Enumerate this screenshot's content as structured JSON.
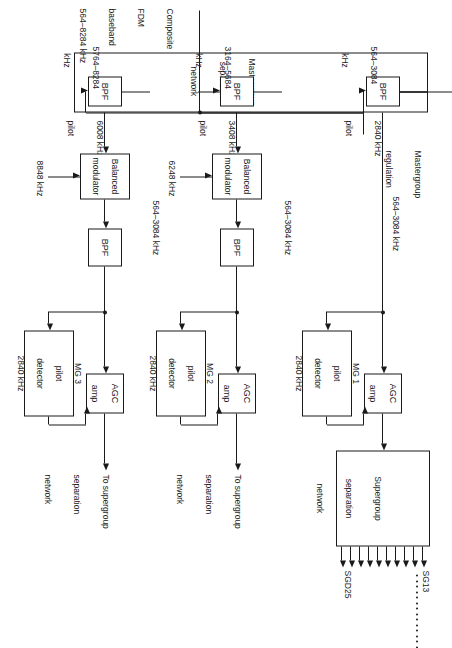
{
  "figure": {
    "orientation_deg": 90
  },
  "colors": {
    "ink": "#1a1a1a",
    "paper": "#ffffff"
  },
  "input": {
    "label_line1": "Composite",
    "label_line2": "FDM",
    "label_line3": "baseband",
    "label_line4": "564–8284 kHz"
  },
  "mastergroup_separation_network": {
    "title_line1": "Mastergroup",
    "title_line2": "separation",
    "title_line3": "network",
    "filters": [
      {
        "name": "BPF",
        "band_line1": "564–3084",
        "band_line2": "kHz"
      },
      {
        "name": "BPF",
        "band_line1": "3164–5684",
        "band_line2": "kHz"
      },
      {
        "name": "BPF",
        "band_line1": "5764–8284",
        "band_line2": "kHz"
      }
    ]
  },
  "pilots": [
    {
      "freq": "2840 kHz",
      "word": "pilot"
    },
    {
      "freq": "3408 kHz",
      "word": "pilot"
    },
    {
      "freq": "6008 kHz",
      "word": "pilot"
    }
  ],
  "chains": [
    {
      "id": "mg1",
      "has_modulator": false,
      "has_second_bpf": false,
      "regulation_line1": "Mastergroup",
      "regulation_line2": "regulation",
      "trunk_band": "564–3084 kHz",
      "agc_line1": "AGC",
      "agc_line2": "amp",
      "detector_line1": "MG 1",
      "detector_line2": "pilot",
      "detector_line3": "detector",
      "detector_line4": "2840 kHz",
      "output_line1": "Supergroup",
      "output_line2": "separation",
      "output_line3": "network",
      "output_is_box": true
    },
    {
      "id": "mg2",
      "has_modulator": true,
      "has_second_bpf": true,
      "modulator_line1": "Balanced",
      "modulator_line2": "modulator",
      "carrier": "6248 kHz",
      "bpf_label": "BPF",
      "trunk_band": "564–3084 kHz",
      "agc_line1": "AGC",
      "agc_line2": "amp",
      "detector_line1": "MG 2",
      "detector_line2": "pilot",
      "detector_line3": "detector",
      "detector_line4": "2840 kHz",
      "output_line1": "To supergroup",
      "output_line2": "separation",
      "output_line3": "network",
      "output_is_box": false
    },
    {
      "id": "mg3",
      "has_modulator": true,
      "has_second_bpf": true,
      "modulator_line1": "Balanced",
      "modulator_line2": "modulator",
      "carrier": "8848 kHz",
      "bpf_label": "BPF",
      "trunk_band": "564–3084 kHz",
      "agc_line1": "AGC",
      "agc_line2": "amp",
      "detector_line1": "MG 3",
      "detector_line2": "pilot",
      "detector_line3": "detector",
      "detector_line4": "2840 kHz",
      "output_line1": "To supergroup",
      "output_line2": "separation",
      "output_line3": "network",
      "output_is_box": false
    }
  ],
  "supergroup_outputs": {
    "first_label": "SG13",
    "last_label": "SGD25",
    "arrow_count": 10,
    "ellipsis_dot_count": 14
  }
}
